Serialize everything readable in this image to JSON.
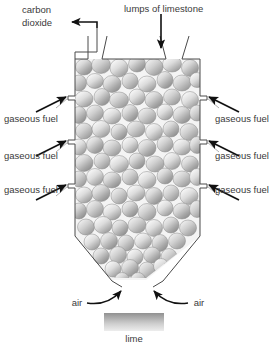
{
  "figure": {
    "background_color": "#ffffff",
    "outline_color": "#4a4a4a",
    "arrow_color": "#111111",
    "leader_color": "#9a9a9a",
    "text_color": "#3a3a3a",
    "stone_fill_light": "#f2f2f2",
    "stone_fill_dark": "#8d8d8d",
    "kiln_interior_fill": "#f4f4f4",
    "lime_block_top_color": "#9b9b9b",
    "lime_block_bottom_color": "#e8e8e8"
  },
  "labels": {
    "carbon_dioxide_line1": "carbon",
    "carbon_dioxide_line2": "dioxide",
    "lumps_of_limestone": "lumps of limestone",
    "gaseous_fuel_left_1": "gaseous fuel",
    "gaseous_fuel_left_2": "gaseous fuel",
    "gaseous_fuel_left_3": "gaseous fuel",
    "gaseous_fuel_right_1": "gaseous fuel",
    "gaseous_fuel_right_2": "gaseous fuel",
    "gaseous_fuel_right_3": "gaseous fuel",
    "air_left": "air",
    "air_right": "air",
    "lime": "lime"
  },
  "icons": {
    "co2_outlet_arrow": "arrow-left-icon",
    "limestone_feed_arrow": "arrow-down-icon",
    "fuel_inlet_arrow": "arrow-diagonal-icon",
    "air_inlet_arrow": "curved-arrow-icon"
  }
}
